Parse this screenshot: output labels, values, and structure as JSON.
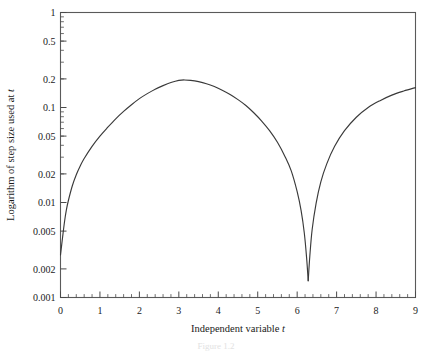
{
  "figure": {
    "caption": "Figure 1.2",
    "background_color": "#ffffff",
    "curve_color": "#3a3a3a",
    "frame_color": "#5a5a5a"
  },
  "chart_data": {
    "type": "line",
    "title": "",
    "xlabel": "Independent variable t",
    "ylabel": "Logarithm of step size used at t",
    "xlabel_plain": "Independent variable",
    "xlabel_italic": "t",
    "ylabel_plain": "Logarithm of step size used at",
    "ylabel_italic": "t",
    "yscale": "log",
    "xscale": "linear",
    "xlim": [
      0,
      9
    ],
    "ylim": [
      0.001,
      1
    ],
    "grid": false,
    "legend": false,
    "x_ticks": [
      0,
      1,
      2,
      3,
      4,
      5,
      6,
      7,
      8,
      9
    ],
    "x_tick_labels": [
      "0",
      "1",
      "2",
      "3",
      "4",
      "5",
      "6",
      "7",
      "8",
      "9"
    ],
    "x_minor_tick_step": 0.2,
    "y_ticks": [
      1,
      0.5,
      0.2,
      0.1,
      0.05,
      0.02,
      0.01,
      0.005,
      0.002,
      0.001
    ],
    "y_tick_labels": [
      "1",
      "0.5",
      "0.2",
      "0.1",
      "0.05",
      "0.02",
      "0.01",
      "0.005",
      "0.002",
      "0.001"
    ],
    "series": [
      {
        "name": "step size",
        "x": [
          0.0,
          0.05,
          0.1,
          0.15,
          0.2,
          0.3,
          0.4,
          0.5,
          0.6,
          0.8,
          1.0,
          1.2,
          1.4,
          1.6,
          1.8,
          2.0,
          2.2,
          2.4,
          2.6,
          2.8,
          3.0,
          3.14,
          3.3,
          3.5,
          3.7,
          3.9,
          4.1,
          4.3,
          4.5,
          4.7,
          4.9,
          5.1,
          5.3,
          5.5,
          5.7,
          5.85,
          6.0,
          6.1,
          6.18,
          6.24,
          6.28,
          6.32,
          6.38,
          6.48,
          6.6,
          6.75,
          6.95,
          7.2,
          7.5,
          7.8,
          8.1,
          8.4,
          8.7,
          9.0
        ],
        "y": [
          0.0028,
          0.0042,
          0.0062,
          0.0084,
          0.0105,
          0.015,
          0.0196,
          0.0242,
          0.029,
          0.039,
          0.05,
          0.062,
          0.076,
          0.091,
          0.107,
          0.124,
          0.14,
          0.156,
          0.17,
          0.183,
          0.193,
          0.195,
          0.193,
          0.187,
          0.178,
          0.166,
          0.152,
          0.137,
          0.121,
          0.105,
          0.088,
          0.072,
          0.057,
          0.043,
          0.03,
          0.0215,
          0.013,
          0.0082,
          0.0048,
          0.0026,
          0.0015,
          0.0027,
          0.0052,
          0.0098,
          0.0165,
          0.0255,
          0.039,
          0.057,
          0.079,
          0.1,
          0.118,
          0.135,
          0.149,
          0.162
        ]
      }
    ],
    "annotations": {
      "peak_x": 3.14,
      "peak_y": 0.195,
      "cusp_x": 6.28,
      "cusp_y": 0.0015,
      "start_x": 0,
      "start_y": 0.0028,
      "end_x": 9,
      "end_y": 0.162
    }
  }
}
